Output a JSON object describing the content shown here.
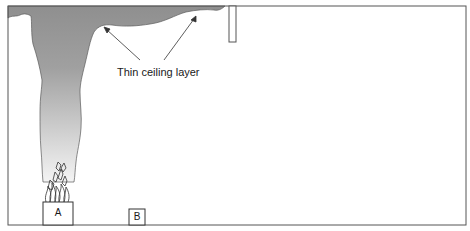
{
  "diagram": {
    "type": "fire-smoke-room-cross-section",
    "annotation": "Thin ceiling layer",
    "objects": [
      {
        "id": "A",
        "label": "A",
        "role": "burning item"
      },
      {
        "id": "B",
        "label": "B",
        "role": "target item"
      }
    ],
    "elements": [
      "room-enclosure",
      "smoke-plume",
      "ceiling-smoke-layer",
      "ceiling-soffit",
      "flames"
    ],
    "colors": {
      "smoke_dark": "#8c8c8c",
      "smoke_light": "#e6e6e6",
      "outline": "#555555",
      "background": "#ffffff"
    }
  }
}
